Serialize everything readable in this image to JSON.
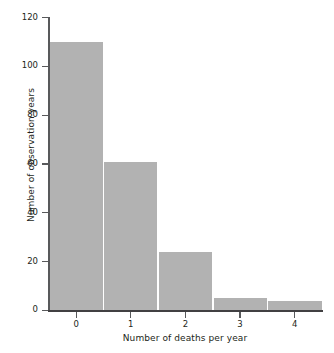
{
  "chart_data": {
    "type": "bar",
    "title": "",
    "subtitle": "",
    "xlabel": "Number of deaths per year",
    "ylabel": "Number of observation years",
    "categories": [
      "0",
      "1",
      "2",
      "3",
      "4"
    ],
    "values": [
      110,
      61,
      24,
      5,
      4
    ],
    "series": [
      {
        "name": "Number of observation years",
        "values": [
          110,
          61,
          24,
          5,
          4
        ]
      }
    ],
    "ylim": [
      0,
      120
    ],
    "xlim": [
      -0.5,
      4.5
    ],
    "yticks": [
      0,
      20,
      40,
      60,
      80,
      100,
      120
    ],
    "ytick_labels": [
      "0",
      "20",
      "40",
      "60",
      "80",
      "100",
      "120"
    ],
    "xticks": [
      0,
      1,
      2,
      3,
      4
    ],
    "xtick_labels": [
      "0",
      "1",
      "2",
      "3",
      "4"
    ],
    "grid": false,
    "legend": false,
    "legend_position": "none",
    "bar_color": "#b2b2b2",
    "axis_color": "#58595b",
    "text_color": "#231f20",
    "background_color": "#ffffff",
    "bar_gap_color": "#ffffff",
    "annotations": []
  }
}
